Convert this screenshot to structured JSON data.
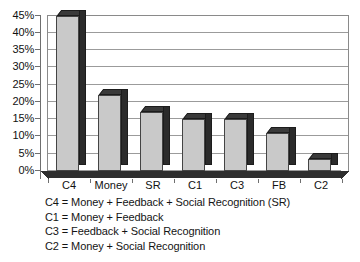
{
  "chart_data": {
    "type": "bar",
    "title": "",
    "subtitle": "",
    "xlabel": "",
    "ylabel": "",
    "categories": [
      "C4",
      "Money",
      "SR",
      "C1",
      "C3",
      "FB",
      "C2"
    ],
    "values": [
      45,
      22,
      17,
      15,
      15,
      11,
      3.5
    ],
    "series": [
      {
        "name": "Percent",
        "values": [
          45,
          22,
          17,
          15,
          15,
          11,
          3.5
        ]
      }
    ],
    "ylim": [
      0,
      45
    ],
    "ytick_labels": [
      "0%",
      "5%",
      "10%",
      "15%",
      "20%",
      "25%",
      "30%",
      "35%",
      "40%",
      "45%"
    ],
    "ytick_values": [
      0,
      5,
      10,
      15,
      20,
      25,
      30,
      35,
      40,
      45
    ],
    "grid": true,
    "grid_axis": "y",
    "legend_position": "below-plot",
    "style": "3d-column-grayscale",
    "annotations": [
      "C4 = Money + Feedback + Social Recognition (SR)",
      "C1 = Money + Feedback",
      "C3 = Feedback + Social Recognition",
      "C2 = Money + Social Recognition"
    ],
    "colors": {
      "bar_front": "#c9c9c9",
      "bar_side": "#2b2b2b",
      "bar_top": "#3a3a3a",
      "gridline": "#9b9b9b",
      "axis": "#6f6f6f",
      "floor": "#2e2e2e",
      "text": "#111111",
      "background": "#ffffff"
    }
  },
  "notes": {
    "lines": [
      "C4 = Money + Feedback + Social Recognition (SR)",
      "C1 = Money + Feedback",
      "C3 = Feedback + Social Recognition",
      "C2 = Money + Social Recognition"
    ]
  }
}
